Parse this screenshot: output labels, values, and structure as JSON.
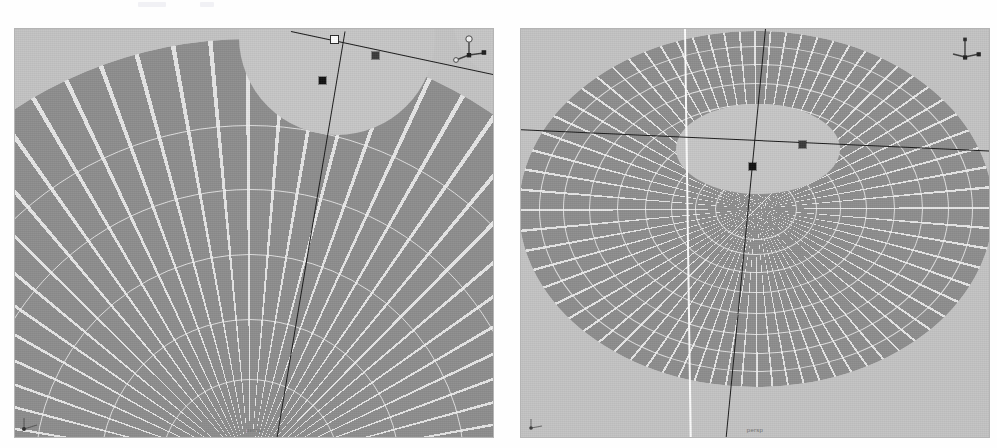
{
  "page": {
    "background_color": "#fefefe",
    "width": 997,
    "height": 448
  },
  "colors": {
    "viewport_background": "#c3c3c3",
    "surface_fill": "#8d8d8d",
    "hole_fill": "#c6c6c6",
    "wireframe": "#f4f4f4",
    "axis_line": "#1a1a1a",
    "white_line": "#fdfdfd",
    "marker": "#111111",
    "label_text": "#6f6f6f"
  },
  "viewports": [
    {
      "id": "left",
      "label": "persp",
      "caption": "persp",
      "projection": "perspective",
      "zoom_state": "zoomed-in",
      "description": "Close-up of meshed annular disc surface with circular hole at top",
      "gizmo": {
        "name": "axis-gizmo",
        "position": "top-right",
        "axes": [
          "x",
          "y",
          "z"
        ]
      },
      "corner_indicator": {
        "name": "world-axis-indicator",
        "position": "bottom-left"
      },
      "markers": [
        {
          "type": "control-point",
          "style": "black",
          "x": 318,
          "y": 78
        },
        {
          "type": "control-point",
          "style": "white",
          "x": 330,
          "y": 38
        },
        {
          "type": "control-point",
          "style": "dim",
          "x": 371,
          "y": 53
        }
      ]
    },
    {
      "id": "right",
      "label": "persp",
      "caption": "persp",
      "projection": "perspective",
      "zoom_state": "full-object",
      "description": "Full meshed annular disc with elliptical hole, radial and circumferential wireframe",
      "gizmo": {
        "name": "axis-gizmo",
        "position": "top-right",
        "axes": [
          "x",
          "y",
          "z"
        ]
      },
      "corner_indicator": {
        "name": "world-axis-indicator",
        "position": "bottom-left"
      },
      "markers": [
        {
          "type": "control-point",
          "style": "black",
          "x": 750,
          "y": 166
        },
        {
          "type": "control-point",
          "style": "dim",
          "x": 800,
          "y": 143
        }
      ]
    }
  ],
  "geometry": {
    "left": {
      "surface_center_x": 236,
      "surface_center_y": 470,
      "surface_radius": 430,
      "hole_center_x": 330,
      "hole_center_y": 8,
      "hole_radius": 92,
      "ring_count": 5,
      "radial_spokes": 72
    },
    "right": {
      "surface_center_x": 755,
      "surface_center_y": 208,
      "surface_radius_x": 237,
      "surface_radius_y": 178,
      "hole_center_x": 757,
      "hole_center_y": 148,
      "hole_radius_x": 82,
      "hole_radius_y": 45,
      "ring_count": 9,
      "radial_spokes": 72
    }
  },
  "icons": {
    "axis_gizmo": "axis-gizmo-icon",
    "world_axis": "world-axis-icon"
  }
}
